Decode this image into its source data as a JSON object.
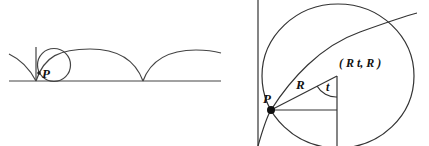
{
  "left_figure": {
    "description": "Cycloid traced by point P on a rolling circle along a baseline",
    "point_label": "P"
  },
  "right_figure": {
    "description": "Enlarged view of rolling circle with center and radius",
    "point_label": "P",
    "radius_label": "R",
    "angle_label": "t",
    "center_label": "( R t, R )"
  },
  "colors": {
    "stroke": "#333333",
    "background": "#ffffff"
  }
}
